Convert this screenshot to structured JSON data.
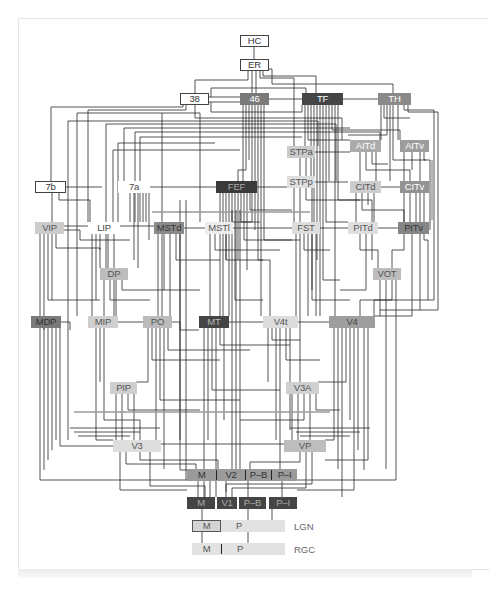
{
  "diagram": {
    "nodes": {
      "HC": "HC",
      "ER": "ER",
      "a38": "38",
      "a46": "46",
      "TF": "TF",
      "TH": "TH",
      "STPa": "STPa",
      "STPp": "STPp",
      "AITd": "AITd",
      "AITv": "AITv",
      "CITd": "CITd",
      "CITv": "CITv",
      "b7": "7b",
      "a7": "7a",
      "FEF": "FEF",
      "VIP": "VIP",
      "LIP": "LIP",
      "MSTd": "MSTd",
      "MSTl": "MSTl",
      "FST": "FST",
      "PITd": "PITd",
      "PITv": "PITv",
      "DP": "DP",
      "VOT": "VOT",
      "MDP": "MDP",
      "MIP": "MIP",
      "PO": "PO",
      "MT": "MT",
      "V4t": "V4t",
      "V4": "V4",
      "PIP": "PIP",
      "V3A": "V3A",
      "V3": "V3",
      "VP": "VP"
    },
    "v2_row": {
      "m": "M",
      "name": "V2",
      "pb": "P–B",
      "pi": "P–I"
    },
    "v1_row": {
      "m": "M",
      "name": "V1",
      "pb": "P–B",
      "pi": "P–I"
    },
    "lgn_row": {
      "m": "M",
      "p": "P",
      "label": "LGN"
    },
    "rgc_row": {
      "m": "M",
      "p": "P",
      "label": "RGC"
    },
    "colors": {
      "darkest": "#3a3a3a",
      "dark": "#4a4a4a",
      "mid_dark": "#777777",
      "mid": "#999999",
      "mid_light": "#b5b5b5",
      "light": "#cccccc",
      "lightest": "#e0e0e0",
      "wire": "#2a2a2a"
    }
  }
}
